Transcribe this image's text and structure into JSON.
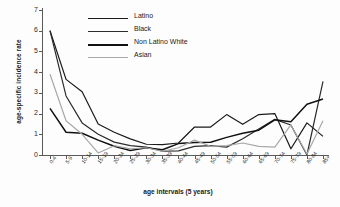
{
  "chart_data": {
    "type": "line",
    "title": "",
    "xlabel": "age intervals (5 years)",
    "ylabel": "age-specific incidence rate",
    "grid": false,
    "legend_position": "top-left",
    "ylim": [
      0,
      7
    ],
    "yticks": [
      0,
      1,
      2,
      3,
      4,
      5,
      6,
      7
    ],
    "categories": [
      "0-4",
      "5-9",
      "10-14",
      "15-19",
      "20-24",
      "25-29",
      "30-34",
      "35-39",
      "40-44",
      "45-49",
      "50-54",
      "55-59",
      "60-64",
      "65-69",
      "70-74",
      "75-79",
      "80-84",
      "85+"
    ],
    "series": [
      {
        "name": "Latino",
        "color": "#1a1a1a",
        "values": [
          6.0,
          3.65,
          3.05,
          1.5,
          1.1,
          0.78,
          0.52,
          0.5,
          0.58,
          1.35,
          1.35,
          1.95,
          1.48,
          1.95,
          2.0,
          0.3,
          1.55,
          0.9
        ]
      },
      {
        "name": "Black",
        "color": "#2b2b2b",
        "values": [
          6.0,
          2.85,
          1.55,
          1.0,
          0.62,
          0.45,
          0.38,
          0.18,
          0.2,
          0.42,
          0.45,
          0.38,
          0.78,
          1.25,
          1.72,
          1.45,
          0.0,
          3.55
        ]
      },
      {
        "name": "Non Latino White",
        "color": "#111111",
        "values": [
          2.25,
          1.1,
          1.05,
          0.72,
          0.42,
          0.22,
          0.35,
          0.25,
          0.55,
          0.6,
          0.62,
          0.85,
          1.05,
          1.2,
          1.7,
          1.6,
          2.45,
          2.7
        ]
      },
      {
        "name": "Asian",
        "color": "#a8a8a8",
        "values": [
          3.9,
          1.65,
          1.0,
          0.1,
          0.45,
          0.3,
          0.35,
          0.18,
          0.35,
          0.72,
          0.42,
          0.45,
          0.58,
          0.42,
          0.38,
          1.45,
          0.05,
          1.65
        ]
      }
    ]
  }
}
